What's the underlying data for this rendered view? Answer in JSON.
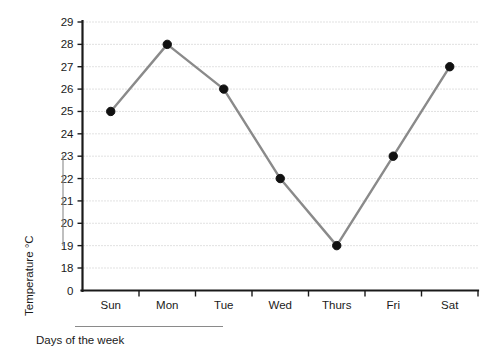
{
  "chart_data": {
    "type": "line",
    "title": "",
    "subtitle": "",
    "xlabel": "Days of the week",
    "ylabel": "Temperature  °C",
    "categories": [
      "Sun",
      "Mon",
      "Tue",
      "Wed",
      "Thurs",
      "Fri",
      "Sat"
    ],
    "values": [
      25,
      28,
      26,
      22,
      19,
      23,
      27
    ],
    "series": [
      {
        "name": "Temperature",
        "values": [
          25,
          28,
          26,
          22,
          19,
          23,
          27
        ]
      }
    ],
    "ylim": [
      18,
      29
    ],
    "y_axis_origin_label": "0",
    "y_axis_broken": true,
    "ytick_labels": [
      "0",
      "18",
      "19",
      "20",
      "21",
      "22",
      "23",
      "24",
      "25",
      "26",
      "27",
      "28",
      "29"
    ],
    "ytick_values": [
      18,
      19,
      20,
      21,
      22,
      23,
      24,
      25,
      26,
      27,
      28,
      29
    ],
    "xtick_labels": [
      "Sun",
      "Mon",
      "Tue",
      "Wed",
      "Thurs",
      "Fri",
      "Sat"
    ],
    "grid": true,
    "grid_style": "dotted-horizontal",
    "legend": false,
    "legend_position": "none",
    "marker": "filled-circle",
    "annotations": [],
    "colors": {
      "line": "#8a8a8a",
      "marker": "#111111",
      "grid": "#bdbdbd",
      "axis": "#1a1a1a",
      "background": "#ffffff",
      "rule": "#8a8a8a"
    }
  },
  "axis_labels": {
    "y_title": "Temperature  °C",
    "x_title": "Days of the week"
  },
  "y_ticks": [
    {
      "label": "29",
      "value": 29
    },
    {
      "label": "28",
      "value": 28
    },
    {
      "label": "27",
      "value": 27
    },
    {
      "label": "26",
      "value": 26
    },
    {
      "label": "25",
      "value": 25
    },
    {
      "label": "24",
      "value": 24
    },
    {
      "label": "23",
      "value": 23
    },
    {
      "label": "22",
      "value": 22
    },
    {
      "label": "21",
      "value": 21
    },
    {
      "label": "20",
      "value": 20
    },
    {
      "label": "19",
      "value": 19
    },
    {
      "label": "18",
      "value": 18
    },
    {
      "label": "0",
      "value": 0
    }
  ],
  "x_ticks": [
    {
      "label": "Sun",
      "value": 25
    },
    {
      "label": "Mon",
      "value": 28
    },
    {
      "label": "Tue",
      "value": 26
    },
    {
      "label": "Wed",
      "value": 22
    },
    {
      "label": "Thurs",
      "value": 19
    },
    {
      "label": "Fri",
      "value": 23
    },
    {
      "label": "Sat",
      "value": 27
    }
  ]
}
